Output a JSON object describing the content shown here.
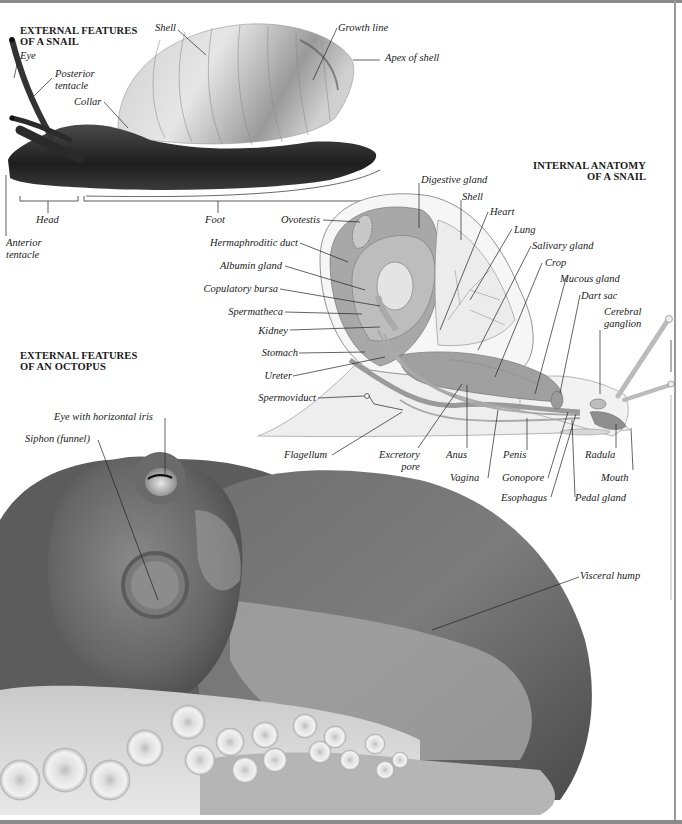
{
  "sections": {
    "snail_external": {
      "title_line1": "EXTERNAL FEATURES",
      "title_line2": "OF A SNAIL",
      "labels": {
        "eye": "Eye",
        "posterior_tentacle_1": "Posterior",
        "posterior_tentacle_2": "tentacle",
        "collar": "Collar",
        "shell": "Shell",
        "growth_line": "Growth line",
        "apex_of_shell": "Apex of shell",
        "head": "Head",
        "foot": "Foot",
        "anterior_tentacle_1": "Anterior",
        "anterior_tentacle_2": "tentacle"
      }
    },
    "snail_internal": {
      "title_line1": "INTERNAL ANATOMY",
      "title_line2": "OF A SNAIL",
      "labels": {
        "digestive_gland": "Digestive gland",
        "shell": "Shell",
        "heart": "Heart",
        "lung": "Lung",
        "salivary_gland": "Salivary gland",
        "crop": "Crop",
        "mucous_gland": "Mucous gland",
        "dart_sac": "Dart sac",
        "cerebral_ganglion_1": "Cerebral",
        "cerebral_ganglion_2": "ganglion",
        "ovotestis": "Ovotestis",
        "hermaphroditic_duct": "Hermaphroditic duct",
        "albumin_gland": "Albumin gland",
        "copulatory_bursa": "Copulatory bursa",
        "spermatheca": "Spermatheca",
        "kidney": "Kidney",
        "stomach": "Stomach",
        "ureter": "Ureter",
        "spermoviduct": "Spermoviduct",
        "flagellum": "Flagellum",
        "excretory_pore_1": "Excretory",
        "excretory_pore_2": "pore",
        "anus": "Anus",
        "vagina": "Vagina",
        "penis": "Penis",
        "gonopore": "Gonopore",
        "esophagus": "Esophagus",
        "radula": "Radula",
        "mouth": "Mouth",
        "pedal_gland": "Pedal gland"
      }
    },
    "octopus_external": {
      "title_line1": "EXTERNAL FEATURES",
      "title_line2": "OF AN OCTOPUS",
      "labels": {
        "eye_horizontal_iris": "Eye with horizontal iris",
        "siphon": "Siphon (funnel)",
        "visceral_hump": "Visceral hump"
      }
    }
  },
  "colors": {
    "ink": "#1a1a1a",
    "snail_body": "#2e2e2e",
    "shell_light": "#d9d9d9",
    "internal_gray": "#9c9c9c",
    "internal_light": "#dcdcdc",
    "octopus_dark": "#555555",
    "octopus_mid": "#7a7a7a",
    "octopus_light": "#c8c8c8",
    "border": "#8a8a8a"
  }
}
